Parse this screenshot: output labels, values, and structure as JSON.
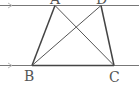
{
  "diagram": {
    "type": "trapezoid-with-diagonals",
    "parallel_lines": [
      {
        "id": "top",
        "y": 5,
        "arrow": true
      },
      {
        "id": "bottom",
        "y": 65,
        "arrow": true
      }
    ],
    "points": {
      "A": {
        "label": "A",
        "x": 55,
        "y": 5
      },
      "D": {
        "label": "D",
        "x": 101,
        "y": 5
      },
      "B": {
        "label": "B",
        "x": 32,
        "y": 65
      },
      "C": {
        "label": "C",
        "x": 114,
        "y": 65
      }
    },
    "segments": [
      "AB",
      "DC",
      "BC",
      "AC",
      "BD"
    ],
    "colors": {
      "line": "#555555",
      "thin": "#777777",
      "arrow": "#bbbbbb"
    }
  }
}
